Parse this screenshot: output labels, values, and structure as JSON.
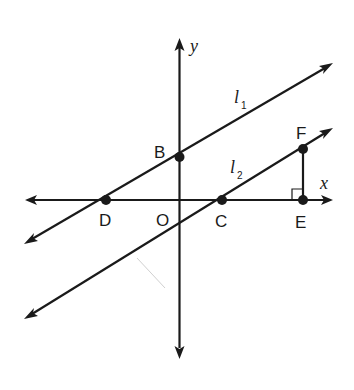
{
  "diagram": {
    "axes": {
      "x_label": "x",
      "y_label": "y",
      "origin_label": "O"
    },
    "lines": [
      {
        "name": "l1",
        "label": "l",
        "subscript": "1",
        "through": [
          "D",
          "B"
        ]
      },
      {
        "name": "l2",
        "label": "l",
        "subscript": "2",
        "through": [
          "C",
          "F"
        ]
      }
    ],
    "points": [
      {
        "label": "B",
        "on": "y-axis, line l1"
      },
      {
        "label": "D",
        "on": "x-axis, line l1"
      },
      {
        "label": "C",
        "on": "x-axis, line l2"
      },
      {
        "label": "E",
        "on": "x-axis"
      },
      {
        "label": "F",
        "on": "line l2"
      }
    ],
    "segments": [
      {
        "from": "E",
        "to": "F",
        "note": "perpendicular to x-axis, right angle at E"
      }
    ],
    "colors": {
      "stroke": "#1a1a1a",
      "background": "#ffffff",
      "stray_mark": "#d0d0d0"
    }
  }
}
